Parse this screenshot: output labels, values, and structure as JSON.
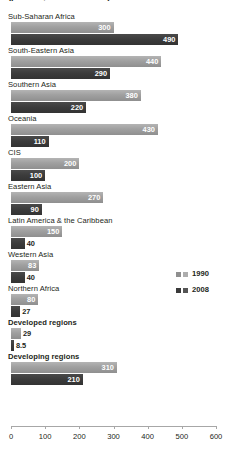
{
  "chart_data": {
    "type": "bar",
    "orientation": "horizontal",
    "title": "(per 100,000 live births)",
    "xlabel": "",
    "ylabel": "",
    "xlim": [
      0,
      600
    ],
    "xticks": [
      0,
      100,
      200,
      300,
      400,
      500,
      600
    ],
    "grid": false,
    "legend_position": "right-middle",
    "categories": [
      "Sub-Saharan Africa",
      "South-Eastern Asia",
      "Southern Asia",
      "Oceania",
      "CIS",
      "Eastern Asia",
      "Latin America & the Caribbean",
      "Western Asia",
      "Northern Africa",
      "Developed regions",
      "Developing regions"
    ],
    "bold_categories": [
      "Developed regions",
      "Developing regions"
    ],
    "series": [
      {
        "name": "1990",
        "color": "#9a9a9a",
        "values": [
          300,
          440,
          380,
          430,
          200,
          270,
          150,
          83,
          80,
          29,
          310
        ],
        "labels": [
          "300",
          "440",
          "380",
          "430",
          "200",
          "270",
          "150",
          "83",
          "80",
          "29",
          "310"
        ]
      },
      {
        "name": "2008",
        "color": "#3c3c3c",
        "values": [
          490,
          290,
          220,
          110,
          100,
          90,
          40,
          40,
          27,
          8.5,
          210
        ],
        "labels": [
          "490",
          "290",
          "220",
          "110",
          "100",
          "90",
          "40",
          "40",
          "27",
          "8.5",
          "210"
        ]
      }
    ]
  },
  "legend": {
    "entries": [
      {
        "label": "1990"
      },
      {
        "label": "2008"
      }
    ]
  }
}
